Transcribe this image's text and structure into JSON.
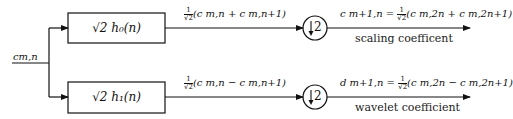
{
  "diagram": {
    "type": "two-channel filter bank (Haar wavelet decomposition)",
    "input": {
      "label": "c_{m,n}",
      "text": "cm,n"
    },
    "branches": [
      {
        "id": "lowpass",
        "filter_label": "√2h0(n)",
        "filter_text": "√2 h₀(n)",
        "intermediate_label": "(c m,n + c m,n+1)",
        "intermediate_prefix": "1/√2",
        "downsampler_label": "↓2",
        "output_label": "c m+1,n = ",
        "output_expr": "(c m,2n + c m,2n+1)",
        "caption": "scaling coefficent"
      },
      {
        "id": "highpass",
        "filter_label": "√2h1(n)",
        "filter_text": "√2 h₁(n)",
        "intermediate_label": "(c m,n − c m,n+1)",
        "intermediate_prefix": "1/√2",
        "downsampler_label": "↓2",
        "output_label": "d m+1,n = ",
        "output_expr": "(c m,2n − c m,2n+1)",
        "caption": "wavelet coefficient"
      }
    ],
    "frac": {
      "num": "1",
      "den": "√2"
    },
    "colors": {
      "stroke": "#111111",
      "background": "#ffffff"
    }
  }
}
